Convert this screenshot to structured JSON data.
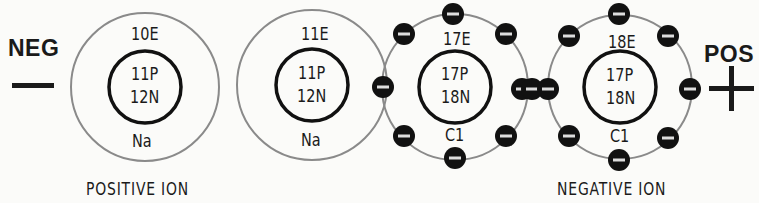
{
  "terminals": {
    "negative": {
      "label": "NEG",
      "symbol": "minus"
    },
    "positive": {
      "label": "POS",
      "symbol": "plus"
    }
  },
  "atoms": [
    {
      "id": "sodium-ion",
      "shell_label": "10E",
      "protons": "11P",
      "neutrons": "12N",
      "symbol": "Na",
      "electrons_shown": 0
    },
    {
      "id": "sodium-atom",
      "shell_label": "11E",
      "protons": "11P",
      "neutrons": "12N",
      "symbol": "Na",
      "electrons_shown": 0
    },
    {
      "id": "chlorine-atom",
      "shell_label": "17E",
      "protons": "17P",
      "neutrons": "18N",
      "symbol": "C1",
      "electrons_shown": 8
    },
    {
      "id": "chlorine-ion",
      "shell_label": "18E",
      "protons": "17P",
      "neutrons": "18N",
      "symbol": "C1",
      "electrons_shown": 9
    }
  ],
  "captions": {
    "positive_ion": "POSITIVE  ION",
    "negative_ion": "NEGATIVE  ION"
  },
  "colors": {
    "outer_shell": "#8a8a8a",
    "nucleus_ring": "#111111",
    "electron": "#111111",
    "background": "#fbfbf9"
  }
}
